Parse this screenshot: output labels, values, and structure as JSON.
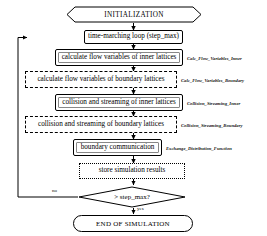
{
  "diagram": {
    "nodes": {
      "initialization": {
        "label": "INITIALIZATION",
        "shape": "hexagon"
      },
      "time_marching_loop": {
        "label": "time-marching loop (step_max)",
        "shape": "box-thin"
      },
      "calc_inner": {
        "label": "calculate flow variables of inner lattices",
        "shape": "box-solid"
      },
      "calc_boundary": {
        "label": "calculate flow variables of boundary lattices",
        "shape": "box-dashed"
      },
      "collide_inner": {
        "label": "collision and streaming of inner lattices",
        "shape": "box-solid"
      },
      "collide_boundary": {
        "label": "collision and streaming of boundary lattices",
        "shape": "box-dashed"
      },
      "boundary_comm": {
        "label": "boundary communication",
        "shape": "box-solid"
      },
      "store_results": {
        "label": "store simulation results",
        "shape": "box-dotted"
      },
      "decision": {
        "label": "> step_max?",
        "shape": "diamond"
      },
      "end": {
        "label": "END OF SIMULATION",
        "shape": "stadium"
      }
    },
    "function_labels": {
      "calc_inner_fn": "Calc_Flow_Variables_Inner",
      "calc_boundary_fn": "Calc_Flow_Variables_Boundary",
      "collide_inner_fn": "Collision_Streaming_Inner",
      "collide_boundary_fn": "Collision_Streaming_Boundary",
      "boundary_comm_fn": "Exchange_Distribution_Function"
    },
    "edge_labels": {
      "no": "no",
      "yes": "yes"
    },
    "colors": {
      "stroke": "#000000",
      "background": "#ffffff",
      "annotation": "#111111"
    }
  }
}
